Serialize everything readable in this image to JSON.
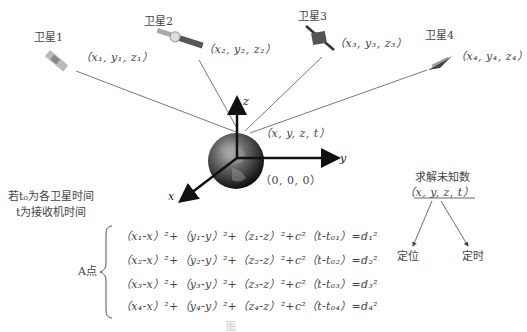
{
  "satellites": [
    {
      "label": "卫星1",
      "coord": "（x₁, y₁, z₁）"
    },
    {
      "label": "卫星2",
      "coord": "（x₂, y₂, z₂）"
    },
    {
      "label": "卫星3",
      "coord": "（x₃, y₃, z₃）"
    },
    {
      "label": "卫星4",
      "coord": "（x₄, y₄, z₄）"
    }
  ],
  "receiver": {
    "coord": "（x, y, z, t）",
    "origin": "（0, 0, 0）"
  },
  "axes": {
    "x": "x",
    "y": "y",
    "z": "z"
  },
  "note": {
    "line1": "若t₀为各卫星时间",
    "line2": "t为接收机时间"
  },
  "solve": {
    "title": "求解未知数",
    "unknowns": "（x, y, z, t）",
    "left": "定位",
    "right": "定时"
  },
  "system": {
    "label": "A点",
    "equations": [
      "（x₁-x）²+（y₁-y）²+（z₁-z）²+c²（t-t₀₁）=d₁²",
      "（x₂-x）²+（y₂-y）²+（z₂-z）²+c²（t-t₀₂）=d₂²",
      "（x₃-x）²+（y₃-y）²+（z₃-z）²+c²（t-t₀₃）=d₃²",
      "（x₄-x）²+（y₄-y）²+（z₄-z）²+c²（t-t₀₄）=d₄²"
    ]
  },
  "caption": "图"
}
